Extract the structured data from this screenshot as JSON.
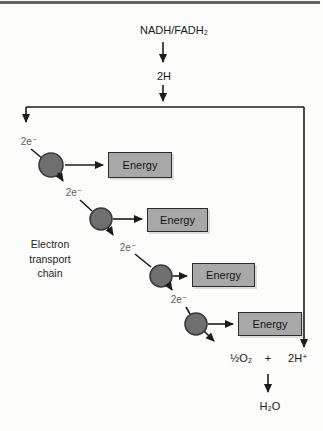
{
  "figure": {
    "top": {
      "substrate": "NADH/FADH₂",
      "carrier": "2H"
    },
    "chain_label": "Electron\ntransport\nchain",
    "electron_steps": [
      "2e⁻",
      "2e⁻",
      "2e⁻",
      "2e⁻"
    ],
    "energy_boxes": [
      {
        "label": "Energy"
      },
      {
        "label": "Energy"
      },
      {
        "label": "Energy"
      },
      {
        "label": "Energy"
      }
    ],
    "products": {
      "oxygen": "½O₂",
      "plus": "+",
      "proton": "2H⁺",
      "water": "H₂O"
    }
  },
  "colors": {
    "paper": "#fcfcfb",
    "line_color": "#1c1c1c",
    "top_rule": "#646464",
    "circle_fill": "#6f6f6f",
    "circle_stroke": "#3a3a3a",
    "box_fill": "#a8a8a8",
    "box_border": "#2c2c2c",
    "electron_label": "#5e5e5e"
  }
}
